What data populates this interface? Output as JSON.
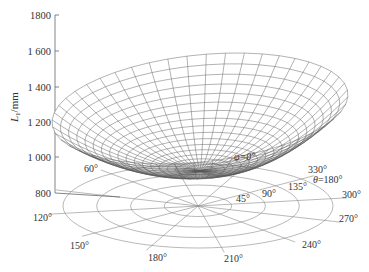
{
  "chart_data": {
    "type": "surface3d",
    "title": "",
    "zlabel": "L1/mm",
    "zlabel_main": "L",
    "zlabel_sub": "1",
    "zlabel_unit": "/mm",
    "z_ticks": [
      {
        "value": 800,
        "label": "800"
      },
      {
        "value": 1000,
        "label": "1 000"
      },
      {
        "value": 1200,
        "label": "1 200"
      },
      {
        "value": 1400,
        "label": "1 400"
      },
      {
        "value": 1600,
        "label": "1 600"
      },
      {
        "value": 1800,
        "label": "1800"
      }
    ],
    "zlim": [
      800,
      1800
    ],
    "base": {
      "type": "polar",
      "radial_variable": "θ",
      "radial_rings": [
        45,
        90,
        135,
        180
      ],
      "radial_labels": [
        "45°",
        "90°",
        "135°",
        "θ=180°"
      ],
      "angular_variable": "φ",
      "angular_spokes": [
        0,
        30,
        60,
        90,
        120,
        150,
        180,
        210,
        240,
        270,
        300,
        330
      ],
      "angular_labels": [
        "φ=0°",
        "",
        "60°",
        "",
        "120°",
        "150°",
        "180°",
        "210°",
        "240°",
        "270°",
        "300°",
        "330°"
      ]
    },
    "surface_description": "Saddle-like bowl surface of L1 over polar (θ, φ) domain; minimum ≈ 1000 mm near front-left, maxima ≈ 1450–1500 mm along back rim, fold near φ≈330°",
    "surface_range": {
      "min": 980,
      "max": 1500
    }
  },
  "labels": {
    "z_title_main": "L",
    "z_title_sub": "1",
    "z_title_unit": "/mm",
    "phi_zero": "φ=0°",
    "theta_max": "θ=180°",
    "deg45": "45°",
    "deg90": "90°",
    "deg135": "135°",
    "a60": "60°",
    "a120": "120°",
    "a150": "150°",
    "a180": "180°",
    "a210": "210°",
    "a240": "240°",
    "a270": "270°",
    "a300": "300°",
    "a330": "330°",
    "z800": "800",
    "z1000": "1 000",
    "z1200": "1 200",
    "z1400": "1 400",
    "z1600": "1 600",
    "z1800": "1800"
  }
}
